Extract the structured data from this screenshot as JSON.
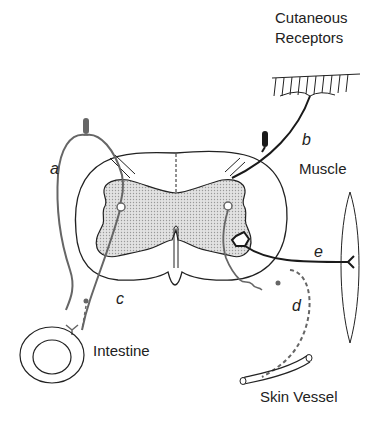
{
  "labels": {
    "cutaneous": "Cutaneous",
    "receptors": "Receptors",
    "muscle": "Muscle",
    "intestine": "Intestine",
    "skin_vessel": "Skin Vessel"
  },
  "pathways": {
    "a": "a",
    "b": "b",
    "c": "c",
    "d": "d",
    "e": "e"
  },
  "colors": {
    "gray_matter": "#d4d4d4",
    "outline": "#222222",
    "visceral_fiber": "#666666",
    "somatic_fiber": "#1a1a1a"
  }
}
